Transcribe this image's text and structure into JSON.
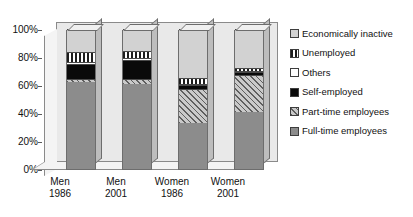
{
  "chart_data": {
    "type": "bar",
    "subtype": "stacked-percentage-3d",
    "title": "",
    "xlabel": "",
    "ylabel": "",
    "ylim": [
      0,
      100
    ],
    "yticks": [
      "0%",
      "20%",
      "40%",
      "60%",
      "80%",
      "100%"
    ],
    "ytick_values": [
      0,
      20,
      40,
      60,
      80,
      100
    ],
    "grid": false,
    "legend_position": "right",
    "categories": [
      "Men 1986",
      "Men 2001",
      "Women 1986",
      "Women 2001"
    ],
    "category_lines": [
      [
        "Men",
        "1986"
      ],
      [
        "Men",
        "2001"
      ],
      [
        "Women",
        "1986"
      ],
      [
        "Women",
        "2001"
      ]
    ],
    "series": [
      {
        "name": "Full-time employees",
        "key": "fulltime",
        "pattern": "solid-gray",
        "color": "#8c8c8c",
        "values": [
          62,
          61,
          33,
          41
        ]
      },
      {
        "name": "Part-time employees",
        "key": "parttime",
        "pattern": "diagonal-hatch",
        "color": "#c9c9c9",
        "values": [
          2,
          3,
          24,
          26
        ]
      },
      {
        "name": "Self-employed",
        "key": "selfemployed",
        "pattern": "solid-black",
        "color": "#0a0a0a",
        "values": [
          11,
          14,
          3,
          2
        ]
      },
      {
        "name": "Others",
        "key": "others",
        "pattern": "solid-white",
        "color": "#ffffff",
        "values": [
          1.5,
          1.5,
          1,
          1
        ]
      },
      {
        "name": "Unemployed",
        "key": "unemployed",
        "pattern": "vertical-stripes",
        "color": "#ffffff",
        "values": [
          7,
          4.5,
          4,
          2.5
        ]
      },
      {
        "name": "Economically inactive",
        "key": "inactive",
        "pattern": "solid-light-gray",
        "color": "#d2d2d2",
        "values": [
          16.5,
          16,
          35,
          27.5
        ]
      }
    ],
    "legend_order": [
      "Economically inactive",
      "Unemployed",
      "Others",
      "Self-employed",
      "Part-time employees",
      "Full-time employees"
    ]
  },
  "legend": {
    "items": [
      {
        "label": "Economically inactive",
        "swatch": "inactive"
      },
      {
        "label": "Unemployed",
        "swatch": "unemployed"
      },
      {
        "label": "Others",
        "swatch": "others"
      },
      {
        "label": "Self-employed",
        "swatch": "selfemployed"
      },
      {
        "label": "Part-time employees",
        "swatch": "parttime"
      },
      {
        "label": "Full-time employees",
        "swatch": "fulltime"
      }
    ]
  }
}
